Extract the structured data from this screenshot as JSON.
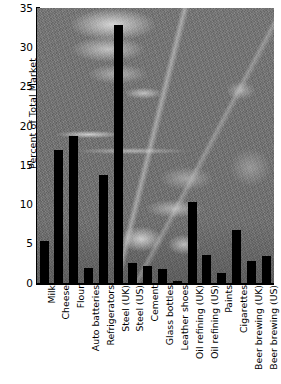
{
  "chart_data": {
    "type": "bar",
    "title": "",
    "xlabel": "",
    "ylabel": "Percent of Total Market",
    "ylim": [
      0,
      35
    ],
    "yticks": [
      0,
      5,
      10,
      15,
      20,
      25,
      30,
      35
    ],
    "grid": false,
    "legend": null,
    "bar_color": "#000000",
    "background": "grayscale industrial scrapyard photograph",
    "categories": [
      "Milk",
      "Cheese",
      "Flour",
      "Auto batteries",
      "Refrigerators",
      "Steel (UK)",
      "Steel (US)",
      "Cement",
      "Glass bottles",
      "Leather shoes",
      "Oil refining (UK)",
      "Oil refining (US)",
      "Paints",
      "Cigarettes",
      "Beer brewing (UK)",
      "Beer brewing (US)"
    ],
    "values": [
      5.3,
      16.9,
      18.7,
      1.9,
      13.7,
      32.8,
      2.5,
      2.2,
      1.8,
      0.3,
      10.3,
      3.6,
      1.3,
      6.8,
      2.8,
      3.4
    ]
  }
}
